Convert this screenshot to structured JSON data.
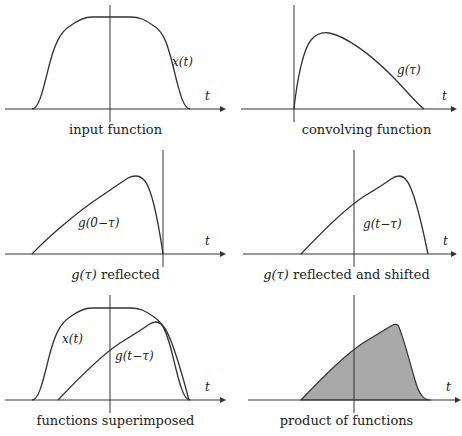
{
  "panels": [
    {
      "id": "p1",
      "caption": "input function",
      "curve_label": "x(t)",
      "axis_label": "t"
    },
    {
      "id": "p2",
      "caption": "convolving function",
      "curve_label": "g(τ)",
      "axis_label": "t"
    },
    {
      "id": "p3",
      "caption_prefix": "g(τ)",
      "caption": "reflected",
      "curve_label": "g(0−τ)",
      "axis_label": "t"
    },
    {
      "id": "p4",
      "caption_prefix": "g(τ)",
      "caption": "reflected and shifted",
      "curve_label": "g(t−τ)",
      "axis_label": "t"
    },
    {
      "id": "p5",
      "caption": "functions superimposed",
      "curve_label": "x(t)",
      "curve_label_2": "g(t−τ)",
      "axis_label": "t"
    },
    {
      "id": "p6",
      "caption": "product of functions",
      "axis_label": "t"
    }
  ],
  "colors": {
    "stroke": "#333333",
    "fill": "#a9a9a9",
    "background": "#ffffff"
  }
}
